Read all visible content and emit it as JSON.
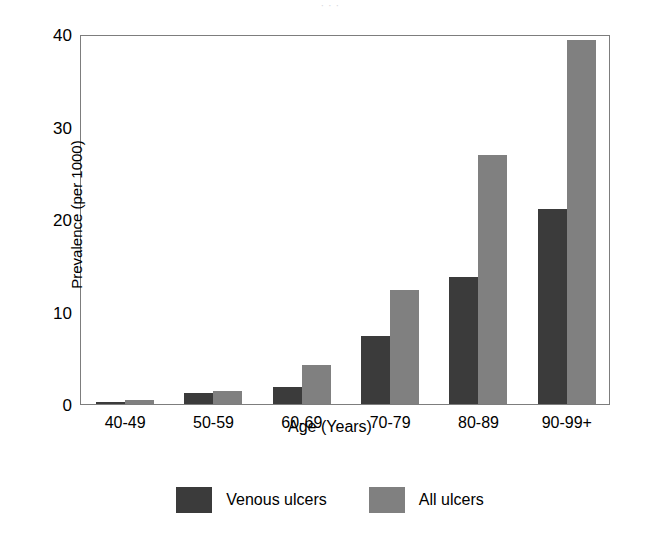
{
  "figure": {
    "caption_remnant": "· · ·"
  },
  "chart_data": {
    "type": "bar",
    "title": "",
    "xlabel": "Age (Years)",
    "ylabel": "Prevalence (per 1000)",
    "categories": [
      "40-49",
      "50-59",
      "60-69",
      "70-79",
      "80-89",
      "90-99+"
    ],
    "series": [
      {
        "name": "Venous ulcers",
        "color": "#3b3b3b",
        "values": [
          0.2,
          1.2,
          1.8,
          7.4,
          13.7,
          21.1
        ]
      },
      {
        "name": "All ulcers",
        "color": "#808080",
        "values": [
          0.45,
          1.4,
          4.2,
          12.3,
          26.9,
          39.4
        ]
      }
    ],
    "ylim": [
      0,
      40
    ],
    "yticks": [
      0,
      10,
      20,
      30,
      40
    ],
    "ytick_labels": [
      "0",
      "10",
      "20",
      "30",
      "40"
    ],
    "grid": false,
    "legend_position": "bottom-center"
  }
}
